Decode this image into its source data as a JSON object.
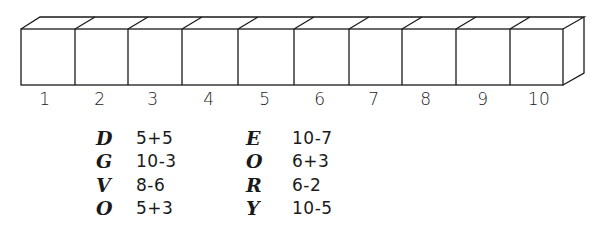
{
  "diagram": {
    "type": "number-strip",
    "boxes": [
      "1",
      "2",
      "3",
      "4",
      "5",
      "6",
      "7",
      "8",
      "9",
      "10"
    ],
    "colors": {
      "stroke": "#1a1a1a",
      "background": "#ffffff"
    }
  },
  "key": {
    "left_column": [
      {
        "letter": "D",
        "expression": "5+5"
      },
      {
        "letter": "G",
        "expression": "10-3"
      },
      {
        "letter": "V",
        "expression": "8-6"
      },
      {
        "letter": "O",
        "expression": "5+3"
      }
    ],
    "right_column": [
      {
        "letter": "E",
        "expression": "10-7"
      },
      {
        "letter": "O",
        "expression": "6+3"
      },
      {
        "letter": "R",
        "expression": "6-2"
      },
      {
        "letter": "Y",
        "expression": "10-5"
      }
    ]
  }
}
